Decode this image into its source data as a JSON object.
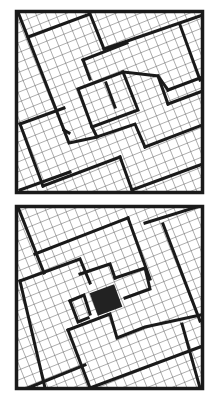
{
  "figure": {
    "stroke_color": "#1a1a1a",
    "grid_color": "#555555",
    "background": "#ffffff",
    "hole_color": "#222222",
    "grid_angle_deg": 22,
    "panels": [
      {
        "name": "top-square",
        "x": 15,
        "y": 10,
        "size": 188,
        "has_hole": false
      },
      {
        "name": "bottom-square",
        "x": 15,
        "y": 204,
        "size": 188,
        "has_hole": true
      }
    ]
  }
}
